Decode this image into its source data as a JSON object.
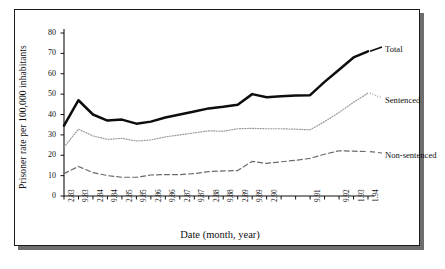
{
  "figure": {
    "ylabel": "Prisoner rate per 100,000 inhabitants",
    "xlabel": "Date (month, year)"
  },
  "labels": {
    "total": "Total",
    "sentenced": "Sentenced",
    "non_sentenced": "Non-sentenced"
  },
  "chart_data": {
    "type": "line",
    "title": "",
    "xlabel": "Date (month, year)",
    "ylabel": "Prisoner rate per 100,000 inhabitants",
    "ylim": [
      0,
      80
    ],
    "yticks": [
      0,
      10,
      20,
      30,
      40,
      50,
      60,
      70,
      80
    ],
    "grid": false,
    "legend_position": "inline-right",
    "categories": [
      "2.83",
      "9.83",
      "2.84",
      "9.84",
      "2.85",
      "9.85",
      "2.86",
      "9.86",
      "2.87",
      "9.87",
      "2.88",
      "9.88",
      "2.89",
      "9.89",
      "2.90",
      "",
      "",
      "9.91",
      "",
      "9.92",
      "1.93",
      "1.94"
    ],
    "tick_labels_visible": [
      "2.83",
      "9.83",
      "2.84",
      "9.84",
      "2.85",
      "9.85",
      "2.86",
      "9.86",
      "2.87",
      "9.87",
      "2.88",
      "9.88",
      "2.89",
      "9.89",
      "2.90",
      "9.91",
      "9.92",
      "1.93",
      "1.94"
    ],
    "series": [
      {
        "name": "Total",
        "style": "solid-thick",
        "values": [
          34.5,
          47.0,
          40.0,
          37.0,
          37.5,
          35.5,
          36.5,
          38.5,
          40.0,
          41.5,
          43.0,
          43.8,
          44.8,
          50.0,
          48.5,
          49.0,
          49.3,
          49.5,
          56.0,
          62.0,
          68.0,
          71.0
        ]
      },
      {
        "name": "Sentenced",
        "style": "dotted",
        "values": [
          24.0,
          32.8,
          29.5,
          27.8,
          28.3,
          27.0,
          27.5,
          29.0,
          30.0,
          31.0,
          32.0,
          31.8,
          33.0,
          33.2,
          33.0,
          33.0,
          32.8,
          32.5,
          36.5,
          41.0,
          46.0,
          50.5
        ]
      },
      {
        "name": "Non-sentenced",
        "style": "dashed",
        "values": [
          11.0,
          14.5,
          11.5,
          10.0,
          9.2,
          9.2,
          10.3,
          10.5,
          10.5,
          11.0,
          12.0,
          12.3,
          12.5,
          17.0,
          16.0,
          16.8,
          17.5,
          18.5,
          20.5,
          22.2,
          22.0,
          21.8
        ]
      }
    ]
  }
}
